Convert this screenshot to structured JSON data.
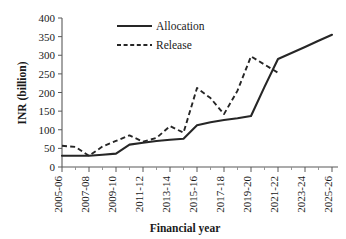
{
  "chart_data": {
    "type": "line",
    "title": "",
    "xlabel": "Financial year",
    "ylabel": "INR (billion)",
    "ylim": [
      0,
      400
    ],
    "ytick_step": 50,
    "yticks": [
      "0",
      "50",
      "100",
      "150",
      "200",
      "250",
      "300",
      "350",
      "400"
    ],
    "grid": false,
    "legend_position": "top-center",
    "categories": [
      "2005-06",
      "2006-07",
      "2007-08",
      "2008-09",
      "2009-10",
      "2010-11",
      "2011-12",
      "2012-13",
      "2013-14",
      "2014-15",
      "2015-16",
      "2016-17",
      "2017-18",
      "2018-19",
      "2019-20",
      "2020-21",
      "2021-22",
      "2022-23",
      "2023-24",
      "2024-25",
      "2025-26"
    ],
    "xtick_labels_shown": [
      "2005-06",
      "2007-08",
      "2009-10",
      "2011-12",
      "2013-14",
      "2015-16",
      "2017-18",
      "2019-20",
      "2021-22",
      "2023-24",
      "2025-26"
    ],
    "series": [
      {
        "name": "Allocation",
        "style": "solid",
        "color": "#262626",
        "values": [
          30,
          30,
          30,
          33,
          36,
          60,
          65,
          70,
          73,
          76,
          112,
          120,
          126,
          131,
          137,
          215,
          290,
          306,
          322,
          339,
          355
        ]
      },
      {
        "name": "Release",
        "style": "dashed",
        "color": "#262626",
        "values": [
          57,
          54,
          30,
          55,
          70,
          85,
          68,
          78,
          110,
          92,
          212,
          185,
          142,
          205,
          297,
          275,
          253,
          null,
          null,
          null,
          null
        ]
      }
    ]
  },
  "legend": {
    "entries": [
      {
        "label": "Allocation",
        "style": "solid"
      },
      {
        "label": "Release",
        "style": "dashed"
      }
    ]
  },
  "axes": {
    "x_title": "Financial year",
    "y_title": "INR (billion)"
  }
}
